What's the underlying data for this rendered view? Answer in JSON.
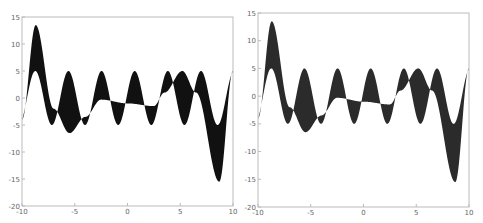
{
  "chart_data": [
    {
      "type": "area",
      "title": "",
      "xlabel": "",
      "ylabel": "",
      "xlim": [
        -10,
        10
      ],
      "ylim": [
        -20,
        15
      ],
      "xticks": [
        "-10",
        "-5",
        "0",
        "5",
        "10"
      ],
      "yticks": [
        "15",
        "10",
        "5",
        "0",
        "-5",
        "-10",
        "-15",
        "-20"
      ],
      "grid": false,
      "fill_color": "#111111",
      "description": "Filled region between y1 = 5*sin(2x+0.2) and a slowly varying curve y2",
      "series": [
        {
          "name": "y1",
          "x": [
            -10,
            -8.7,
            -7.2,
            -5.6,
            -4.1,
            -2.5,
            -1.0,
            0.7,
            2.2,
            3.8,
            5.4,
            7.0,
            8.5,
            10
          ],
          "values": [
            -4,
            5,
            -5,
            5,
            -5,
            5,
            -5,
            5,
            -5,
            5,
            -5,
            5,
            -5,
            5
          ]
        },
        {
          "name": "y2",
          "x": [
            -10,
            -8.7,
            -7.0,
            -5.5,
            -4.0,
            -2.5,
            0,
            2.5,
            3.5,
            5.2,
            6.5,
            8.7,
            10
          ],
          "values": [
            -4,
            13.5,
            -2,
            -6.5,
            -3.5,
            -0.3,
            -1,
            -1.5,
            1,
            5,
            1,
            -15.5,
            5
          ]
        }
      ]
    },
    {
      "type": "area",
      "title": "",
      "xlabel": "",
      "ylabel": "",
      "xlim": [
        -10,
        10
      ],
      "ylim": [
        -20,
        15
      ],
      "xticks": [
        "-10",
        "-5",
        "0",
        "5",
        "10"
      ],
      "yticks": [
        "15",
        "10",
        "5",
        "0",
        "-5",
        "-10",
        "-15",
        "-20"
      ],
      "grid": false,
      "fill_color": "#2b2b2b",
      "description": "Same filled region, rendered in dark gray",
      "series": [
        {
          "name": "y1",
          "x": [
            -10,
            -8.7,
            -7.2,
            -5.6,
            -4.1,
            -2.5,
            -1.0,
            0.7,
            2.2,
            3.8,
            5.4,
            7.0,
            8.5,
            10
          ],
          "values": [
            -4,
            5,
            -5,
            5,
            -5,
            5,
            -5,
            5,
            -5,
            5,
            -5,
            5,
            -5,
            5
          ]
        },
        {
          "name": "y2",
          "x": [
            -10,
            -8.7,
            -7.0,
            -5.5,
            -4.0,
            -2.5,
            0,
            2.5,
            3.5,
            5.2,
            6.5,
            8.7,
            10
          ],
          "values": [
            -4,
            13.5,
            -2,
            -6.5,
            -3.5,
            -0.3,
            -1,
            -1.5,
            1,
            5,
            1,
            -15.5,
            5
          ]
        }
      ]
    }
  ],
  "panels": [
    {
      "left": 22,
      "top": 17,
      "right": 233,
      "bottom": 206
    },
    {
      "left": 258,
      "top": 13,
      "right": 469,
      "bottom": 207
    }
  ]
}
